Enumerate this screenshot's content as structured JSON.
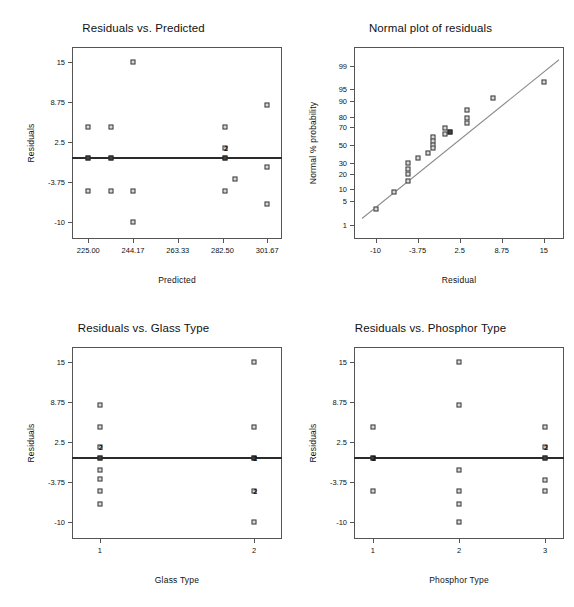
{
  "page": {
    "width": 574,
    "height": 607,
    "background": "#ffffff"
  },
  "chart_data": [
    {
      "id": "residuals-vs-predicted",
      "type": "scatter",
      "title": "Residuals vs. Predicted",
      "xlabel": "Predicted",
      "ylabel": "Residuals",
      "xticks": [
        "225.00",
        "244.17",
        "263.33",
        "282.50",
        "301.67"
      ],
      "xtick_values": [
        225.0,
        244.17,
        263.33,
        282.5,
        301.67
      ],
      "yticks": [
        "15",
        "8.75",
        "2.5",
        "-3.75",
        "-10"
      ],
      "ytick_values": [
        15,
        8.75,
        2.5,
        -3.75,
        -10
      ],
      "xlim": [
        218.0,
        308.0
      ],
      "ylim": [
        -12.6,
        17.3
      ],
      "grid": false,
      "reference_line": {
        "y": 0.0,
        "style": "solid",
        "color": "#2b2b2b"
      },
      "points": [
        {
          "x": 225.0,
          "y": 4.8
        },
        {
          "x": 225.0,
          "y": 0.0,
          "filled": true
        },
        {
          "x": 225.0,
          "y": -5.2
        },
        {
          "x": 234.5,
          "y": 4.8
        },
        {
          "x": 234.5,
          "y": 0.0,
          "filled": true
        },
        {
          "x": 234.5,
          "y": -5.2
        },
        {
          "x": 244.17,
          "y": 15.0
        },
        {
          "x": 244.17,
          "y": -5.2
        },
        {
          "x": 244.17,
          "y": -10.0
        },
        {
          "x": 283.5,
          "y": 4.8
        },
        {
          "x": 283.5,
          "y": 1.6,
          "dup": "2"
        },
        {
          "x": 283.5,
          "y": 0.0,
          "filled": true
        },
        {
          "x": 283.5,
          "y": -5.2
        },
        {
          "x": 288.0,
          "y": -3.3
        },
        {
          "x": 301.67,
          "y": 8.3
        },
        {
          "x": 301.67,
          "y": -1.4
        },
        {
          "x": 301.67,
          "y": -7.2
        }
      ]
    },
    {
      "id": "normal-plot-of-residuals",
      "type": "scatter",
      "title": "Normal plot of residuals",
      "xlabel": "Residual",
      "ylabel": "Normal % probability",
      "xticks": [
        "-10",
        "-3.75",
        "2.5",
        "8.75",
        "15"
      ],
      "xtick_values": [
        -10,
        -3.75,
        2.5,
        8.75,
        15
      ],
      "yticks": [
        "1",
        "5",
        "10",
        "20",
        "30",
        "50",
        "70",
        "80",
        "90",
        "95",
        "99"
      ],
      "ytick_values": [
        1,
        5,
        10,
        20,
        30,
        50,
        70,
        80,
        90,
        95,
        99
      ],
      "xlim": [
        -13.2,
        18.0
      ],
      "ylim_probability": [
        0.3,
        99.8
      ],
      "grid": false,
      "reference_line": {
        "style": "solid",
        "color": "#8c8c8c",
        "label": "normal-fit-line"
      },
      "points": [
        {
          "x": -10.0,
          "p": 3.1
        },
        {
          "x": -7.2,
          "p": 8.5
        },
        {
          "x": -5.2,
          "p": 30.0
        },
        {
          "x": -5.2,
          "p": 24.0
        },
        {
          "x": -5.2,
          "p": 20.0
        },
        {
          "x": -5.2,
          "p": 14.5
        },
        {
          "x": -3.75,
          "p": 35.0
        },
        {
          "x": -2.2,
          "p": 41.5
        },
        {
          "x": -1.4,
          "p": 59.0
        },
        {
          "x": -1.4,
          "p": 54.5
        },
        {
          "x": -1.4,
          "p": 50.0
        },
        {
          "x": -1.4,
          "p": 47.0
        },
        {
          "x": 0.3,
          "p": 69.0
        },
        {
          "x": 0.3,
          "p": 63.0
        },
        {
          "x": 1.1,
          "p": 65.5,
          "filled": true
        },
        {
          "x": 3.6,
          "p": 85.0
        },
        {
          "x": 3.6,
          "p": 79.0
        },
        {
          "x": 3.6,
          "p": 74.0
        },
        {
          "x": 7.4,
          "p": 91.5
        },
        {
          "x": 15.0,
          "p": 96.8
        }
      ]
    },
    {
      "id": "residuals-vs-glass-type",
      "type": "scatter",
      "title": "Residuals vs. Glass Type",
      "xlabel": "Glass Type",
      "ylabel": "Residuals",
      "xticks": [
        "1",
        "2"
      ],
      "xtick_values": [
        1,
        2
      ],
      "yticks": [
        "15",
        "8.75",
        "2.5",
        "-3.75",
        "-10"
      ],
      "ytick_values": [
        15,
        8.75,
        2.5,
        -3.75,
        -10
      ],
      "xlim": [
        0.82,
        2.18
      ],
      "ylim": [
        -12.6,
        17.3
      ],
      "grid": false,
      "reference_line": {
        "y": 0.0,
        "style": "solid",
        "color": "#2b2b2b"
      },
      "points": [
        {
          "x": 1,
          "y": 8.3
        },
        {
          "x": 1,
          "y": 4.8
        },
        {
          "x": 1,
          "y": 1.7,
          "dup": "2"
        },
        {
          "x": 1,
          "y": 0.0,
          "filled": true
        },
        {
          "x": 1,
          "y": -1.8
        },
        {
          "x": 1,
          "y": -3.3
        },
        {
          "x": 1,
          "y": -5.2
        },
        {
          "x": 1,
          "y": -7.2
        },
        {
          "x": 2,
          "y": 15.0
        },
        {
          "x": 2,
          "y": 4.8
        },
        {
          "x": 2,
          "y": 0.0,
          "filled": true,
          "dup": "2"
        },
        {
          "x": 2,
          "y": -5.2,
          "dup": "2"
        },
        {
          "x": 2,
          "y": -10.0
        }
      ]
    },
    {
      "id": "residuals-vs-phosphor-type",
      "type": "scatter",
      "title": "Residuals vs. Phosphor Type",
      "xlabel": "Phosphor Type",
      "ylabel": "Residuals",
      "xticks": [
        "1",
        "2",
        "3"
      ],
      "xtick_values": [
        1,
        2,
        3
      ],
      "yticks": [
        "15",
        "8.75",
        "2.5",
        "-3.75",
        "-10"
      ],
      "ytick_values": [
        15,
        8.75,
        2.5,
        -3.75,
        -10
      ],
      "xlim": [
        0.78,
        3.22
      ],
      "ylim": [
        -12.6,
        17.3
      ],
      "grid": false,
      "reference_line": {
        "y": 0.0,
        "style": "solid",
        "color": "#2b2b2b"
      },
      "points": [
        {
          "x": 1,
          "y": 4.8
        },
        {
          "x": 1,
          "y": 0.0,
          "filled": true,
          "dup": "2"
        },
        {
          "x": 1,
          "y": -5.2
        },
        {
          "x": 2,
          "y": 15.0
        },
        {
          "x": 2,
          "y": 8.3
        },
        {
          "x": 2,
          "y": -1.8
        },
        {
          "x": 2,
          "y": -5.2
        },
        {
          "x": 2,
          "y": -7.2
        },
        {
          "x": 2,
          "y": -10.0
        },
        {
          "x": 3,
          "y": 4.8
        },
        {
          "x": 3,
          "y": 1.7,
          "dup": "2"
        },
        {
          "x": 3,
          "y": 0.0,
          "filled": true
        },
        {
          "x": 3,
          "y": -3.4
        },
        {
          "x": 3,
          "y": -5.2
        }
      ]
    }
  ]
}
